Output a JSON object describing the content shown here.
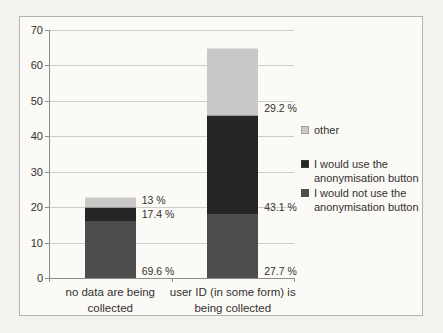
{
  "page": {
    "background_color": "#f4f2ee",
    "frame_border_color": "#b5b3af",
    "frame_background_color": "#fbfaf7"
  },
  "chart_data": {
    "type": "bar",
    "stacked": true,
    "title": "",
    "xlabel": "",
    "ylabel": "",
    "grid": true,
    "legend_position": "right",
    "y_axis": {
      "min": 0,
      "max": 70,
      "tick_step": 10,
      "ticks": [
        0,
        10,
        20,
        30,
        40,
        50,
        60,
        70
      ]
    },
    "categories": [
      {
        "label": "no data are being collected",
        "lines": [
          "no data are being",
          "collected"
        ],
        "total": 23
      },
      {
        "label": "user ID (in some form) is being collected",
        "lines": [
          "user ID (in some form) is",
          "being collected"
        ],
        "total": 65
      }
    ],
    "series": [
      {
        "name": "I would not use the anonymisation button",
        "color": "#4e4d4e",
        "values": [
          16,
          18
        ],
        "percent_labels": [
          "69.6 %",
          "27.7 %"
        ]
      },
      {
        "name": "I would use the anonymisation button",
        "color": "#262526",
        "values": [
          4,
          28
        ],
        "percent_labels": [
          "17.4 %",
          "43.1 %"
        ]
      },
      {
        "name": "other",
        "color": "#c9c8c6",
        "values": [
          3,
          19
        ],
        "percent_labels": [
          "13 %",
          "29.2 %"
        ]
      }
    ],
    "legend": [
      {
        "label": "other",
        "color": "#c9c8c6",
        "lines": [
          "other"
        ]
      },
      {
        "label": "I would use the anonymisation button",
        "color": "#262526",
        "lines": [
          "I would use the",
          "anonymisation button"
        ]
      },
      {
        "label": "I would not use the anonymisation button",
        "color": "#4e4d4e",
        "lines": [
          "I would not use the",
          "anonymisation button"
        ]
      }
    ]
  },
  "layout": {
    "plot": {
      "left": 29,
      "top": 13,
      "width": 245,
      "height": 248
    },
    "bar_width": 51,
    "legend_item_tops": [
      106,
      140,
      169
    ]
  }
}
